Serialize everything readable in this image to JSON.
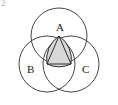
{
  "figure": {
    "caption_corner_mark": "2",
    "background_color": "#ffffff",
    "stroke_color": "#303030",
    "shade_color": "#d8d8d8",
    "label_color": "#1a1a1a",
    "width": 118,
    "height": 105
  },
  "labels": {
    "a": "A",
    "b": "B",
    "c": "C"
  },
  "chart_data": {
    "type": "diagram",
    "units": "pixels",
    "circles": [
      {
        "name": "circle-A",
        "center_label": "A",
        "cx": 59,
        "cy": 36,
        "r": 28
      },
      {
        "name": "circle-B",
        "center_label": "B",
        "cx": 47,
        "cy": 64,
        "r": 28
      },
      {
        "name": "circle-C",
        "center_label": "C",
        "cx": 71,
        "cy": 64,
        "r": 28
      }
    ],
    "triangle": {
      "name": "triangle-ABC",
      "vertices": [
        {
          "label": "A",
          "x": 59,
          "y": 36
        },
        {
          "label": "B",
          "x": 47,
          "y": 64
        },
        {
          "label": "C",
          "x": 71,
          "y": 64
        }
      ],
      "side_length": 28,
      "kind": "equilateral"
    },
    "shaded_region": {
      "name": "reuleaux-triangle",
      "fill": "#d8d8d8",
      "stroke": "#303030",
      "vertices": [
        "A",
        "B",
        "C"
      ],
      "arc_radius": 28,
      "note": "intersection of all three circles"
    },
    "label_positions": [
      {
        "text": "A",
        "x": 59,
        "y": 28,
        "anchor": "above-vertex"
      },
      {
        "text": "B",
        "x": 37,
        "y": 70,
        "anchor": "left-of-vertex"
      },
      {
        "text": "C",
        "x": 82,
        "y": 70,
        "anchor": "right-of-vertex"
      }
    ],
    "legend": [],
    "grid": false
  }
}
